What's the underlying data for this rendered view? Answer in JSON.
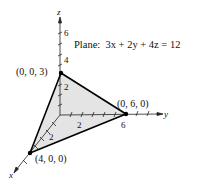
{
  "figure": {
    "plane_label": "Plane:  3x + 2y + 4z = 12",
    "axes": {
      "x_label": "x",
      "y_label": "y",
      "z_label": "z"
    },
    "ticks": {
      "z": [
        "2",
        "4",
        "6"
      ],
      "y": [
        "2",
        "6"
      ],
      "x": [
        "2"
      ]
    },
    "points": {
      "z_intercept": "(0, 0, 3)",
      "y_intercept": "(0, 6, 0)",
      "x_intercept": "(4, 0, 0)"
    },
    "colors": {
      "plane_fill": "#e4e4e4",
      "edge": "#000000",
      "axis": "#222222"
    }
  }
}
